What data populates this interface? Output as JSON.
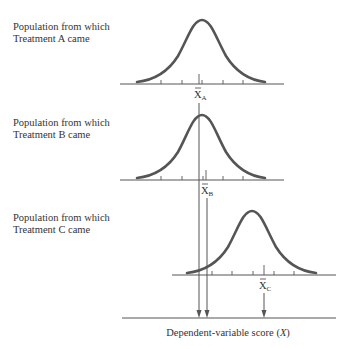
{
  "panels": [
    {
      "id": "A",
      "label_line1": "Population from which",
      "label_line2": "Treatment A came",
      "mean_symbol": "X",
      "mean_subscript": "A"
    },
    {
      "id": "B",
      "label_line1": "Population from which",
      "label_line2": "Treatment B came",
      "mean_symbol": "X",
      "mean_subscript": "B"
    },
    {
      "id": "C",
      "label_line1": "Population from which",
      "label_line2": "Treatment C came",
      "mean_symbol": "X",
      "mean_subscript": "C"
    }
  ],
  "bottom_axis": {
    "label_prefix": "Dependent-variable score (",
    "label_var": "X",
    "label_suffix": ")"
  },
  "colors": {
    "ink": "#555555",
    "text": "#333333",
    "background": "#ffffff"
  }
}
